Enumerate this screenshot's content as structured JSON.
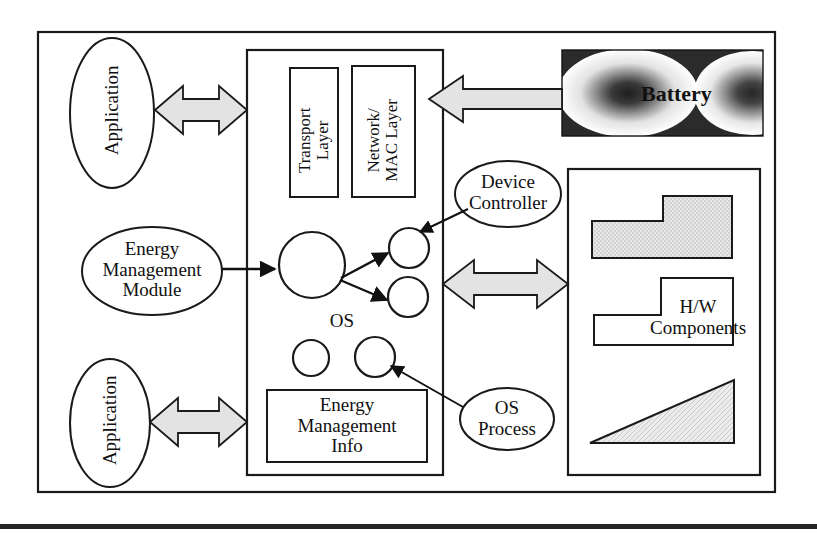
{
  "diagram": {
    "outer_frame": {
      "name": "system-boundary"
    },
    "application_top": {
      "label": "Application"
    },
    "application_bottom": {
      "label": "Application"
    },
    "energy_management_module": {
      "label": "Energy\nManagement\nModule"
    },
    "os_box": {
      "label": "OS"
    },
    "transport_layer": {
      "label": "Transport\nLayer"
    },
    "network_mac_layer": {
      "label": "Network/\nMAC Layer"
    },
    "energy_management_info": {
      "label": "Energy\nManagement\nInfo"
    },
    "device_controller": {
      "label": "Device\nController"
    },
    "os_process": {
      "label": "OS\nProcess"
    },
    "battery": {
      "label": "Battery"
    },
    "hw_components": {
      "label": "H/W\nComponents"
    },
    "colors": {
      "stroke": "#1a1a1a",
      "arrow_fill": "#e3e3e3",
      "hatch_fill": "#d6d6d6",
      "battery_dark": "#2b2b2b",
      "page_bg": "#ffffff",
      "footer_rule": "#262626"
    },
    "connectors": [
      {
        "name": "app-top-to-os",
        "type": "double-arrow"
      },
      {
        "name": "app-bottom-to-os",
        "type": "double-arrow"
      },
      {
        "name": "battery-to-os",
        "type": "single-arrow-left"
      },
      {
        "name": "os-to-hw",
        "type": "double-arrow"
      },
      {
        "name": "emm-to-os-core",
        "type": "line-arrow"
      },
      {
        "name": "os-core-to-proc-upper",
        "type": "line-arrow"
      },
      {
        "name": "os-core-to-proc-lower",
        "type": "line-arrow"
      },
      {
        "name": "device-controller-to-proc",
        "type": "line-arrow"
      },
      {
        "name": "os-process-to-proc",
        "type": "line-arrow"
      }
    ]
  }
}
